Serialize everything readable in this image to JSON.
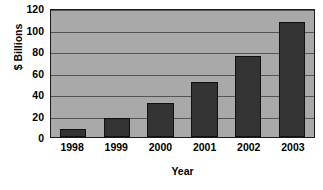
{
  "chart_data": {
    "type": "bar",
    "title": "",
    "subtitle": "",
    "xlabel": "Year",
    "ylabel": "$ Billions",
    "categories": [
      "1998",
      "1999",
      "2000",
      "2001",
      "2002",
      "2003"
    ],
    "values": [
      7,
      18,
      32,
      51,
      75,
      107
    ],
    "series": [
      {
        "name": "",
        "values": [
          7,
          18,
          32,
          51,
          75,
          107
        ]
      }
    ],
    "ylim": [
      0,
      120
    ],
    "ytick_labels": [
      "0",
      "20",
      "40",
      "60",
      "80",
      "100",
      "120"
    ],
    "ytick_values": [
      0,
      20,
      40,
      60,
      80,
      100,
      120
    ],
    "grid": true,
    "grid_axis": "y",
    "legend": false,
    "legend_position": "none",
    "annotations": [],
    "colors": {
      "bar_fill": "#333333",
      "bar_border": "#111111",
      "plot_background": "#a9a9a9",
      "plot_border": "#1a1a1a",
      "gridline": "#555555",
      "text": "#000000",
      "figure_background": "#ffffff"
    }
  }
}
